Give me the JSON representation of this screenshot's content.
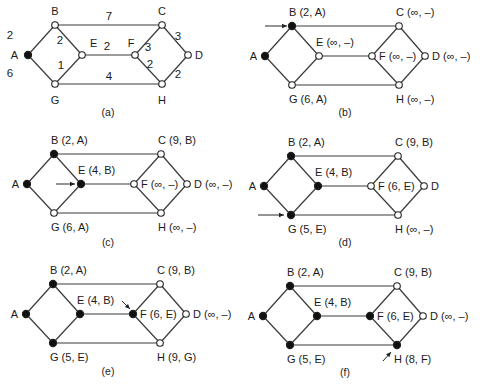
{
  "figure": {
    "node_colors": {
      "permanent": "#111111",
      "tentative": "#ffffff",
      "stroke": "#222222"
    },
    "graph": {
      "nodes": [
        "A",
        "B",
        "C",
        "D",
        "E",
        "F",
        "G",
        "H"
      ],
      "edges": [
        {
          "from": "A",
          "to": "B",
          "weight": "2"
        },
        {
          "from": "A",
          "to": "G",
          "weight": "6"
        },
        {
          "from": "B",
          "to": "C",
          "weight": "7"
        },
        {
          "from": "B",
          "to": "E",
          "weight": "2"
        },
        {
          "from": "E",
          "to": "G",
          "weight": "1"
        },
        {
          "from": "E",
          "to": "F",
          "weight": "2"
        },
        {
          "from": "G",
          "to": "H",
          "weight": "4"
        },
        {
          "from": "C",
          "to": "F",
          "weight": "3"
        },
        {
          "from": "C",
          "to": "D",
          "weight": "3"
        },
        {
          "from": "F",
          "to": "H",
          "weight": "2"
        },
        {
          "from": "D",
          "to": "H",
          "weight": "2"
        }
      ]
    },
    "panels": [
      {
        "id": "a",
        "caption": "(a)",
        "labels": {
          "A": "A",
          "B": "B",
          "C": "C",
          "D": "D",
          "E": "E",
          "F": "F",
          "G": "G",
          "H": "H"
        },
        "filled": [
          "A"
        ],
        "arrow_to": null
      },
      {
        "id": "b",
        "caption": "(b)",
        "labels": {
          "A": "A",
          "B": "B (2, A)",
          "C": "C (∞, –)",
          "D": "D (∞, –)",
          "E": "E (∞, –)",
          "F": "F (∞, –)",
          "G": "G (6, A)",
          "H": "H (∞, –)"
        },
        "filled": [
          "A",
          "B"
        ],
        "arrow_to": "B"
      },
      {
        "id": "c",
        "caption": "(c)",
        "labels": {
          "A": "A",
          "B": "B (2, A)",
          "C": "C (9, B)",
          "D": "D (∞, –)",
          "E": "E (4, B)",
          "F": "F (∞, –)",
          "G": "G (6, A)",
          "H": "H (∞, –)"
        },
        "filled": [
          "A",
          "B",
          "E"
        ],
        "arrow_to": "E"
      },
      {
        "id": "d",
        "caption": "(d)",
        "labels": {
          "A": "A",
          "B": "B (2, A)",
          "C": "C (9, B)",
          "D": "D",
          "E": "E (4, B)",
          "F": "F (6, E)",
          "G": "G (5, E)",
          "H": "H (∞, –)"
        },
        "filled": [
          "A",
          "B",
          "E",
          "G"
        ],
        "arrow_to": "G"
      },
      {
        "id": "e",
        "caption": "(e)",
        "labels": {
          "A": "A",
          "B": "B (2, A)",
          "C": "C (9, B)",
          "D": "D (∞, –)",
          "E": "E (4, B)",
          "F": "F (6, E)",
          "G": "G (5, E)",
          "H": "H (9, G)"
        },
        "filled": [
          "A",
          "B",
          "E",
          "G",
          "F"
        ],
        "arrow_to": "F"
      },
      {
        "id": "f",
        "caption": "(f)",
        "labels": {
          "A": "A",
          "B": "B (2, A)",
          "C": "C (9, B)",
          "D": "D (∞, –)",
          "E": "E (4, B)",
          "F": "F (6, E)",
          "G": "G (5, E)",
          "H": "H (8, F)"
        },
        "filled": [
          "A",
          "B",
          "E",
          "G",
          "F",
          "H"
        ],
        "arrow_to": "H"
      }
    ]
  }
}
